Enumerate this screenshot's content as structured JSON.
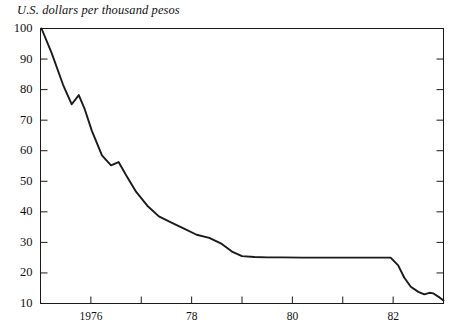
{
  "chart_data": {
    "type": "line",
    "title": "U.S. dollars per thousand pesos",
    "xlabel": "",
    "ylabel": "U.S. dollars per thousand pesos",
    "ylim": [
      10,
      100
    ],
    "xlim": [
      1975.5,
      1983.5
    ],
    "grid": false,
    "legend": null,
    "y_ticks": [
      100,
      90,
      80,
      70,
      60,
      50,
      40,
      30,
      20,
      10
    ],
    "y_tick_labels": [
      "100",
      "90",
      "80",
      "70",
      "60",
      "50",
      "40",
      "30",
      "20",
      "10"
    ],
    "x_ticks": [
      1975.5,
      1976.5,
      1977.5,
      1978.5,
      1979.5,
      1980.5,
      1981.5,
      1982.5,
      1983.5
    ],
    "x_tick_labels": [
      "",
      "1976",
      "",
      "78",
      "",
      "80",
      "",
      "82",
      ""
    ],
    "x_labeled_ticks": [
      {
        "value": 1976.5,
        "label": "1976"
      },
      {
        "value": 1978.5,
        "label": "78"
      },
      {
        "value": 1980.5,
        "label": "80"
      },
      {
        "value": 1982.5,
        "label": "82"
      }
    ],
    "series": [
      {
        "name": "U.S. dollars per thousand pesos",
        "color": "#1a1a1a",
        "x": [
          1975.52,
          1975.72,
          1975.95,
          1976.12,
          1976.26,
          1976.38,
          1976.52,
          1976.72,
          1976.9,
          1977.05,
          1977.2,
          1977.4,
          1977.62,
          1977.85,
          1978.1,
          1978.35,
          1978.6,
          1978.85,
          1979.1,
          1979.3,
          1979.5,
          1979.75,
          1980.0,
          1980.3,
          1980.7,
          1981.2,
          1981.7,
          1982.1,
          1982.45,
          1982.6,
          1982.72,
          1982.85,
          1983.0,
          1983.12,
          1983.22,
          1983.3,
          1983.42,
          1983.5
        ],
        "y": [
          100.0,
          92.0,
          81.5,
          75.2,
          78.2,
          73.5,
          66.5,
          58.5,
          55.2,
          56.3,
          52.0,
          46.5,
          42.0,
          38.5,
          36.5,
          34.5,
          32.5,
          31.5,
          29.5,
          27.0,
          25.5,
          25.2,
          25.1,
          25.1,
          25.0,
          25.0,
          25.0,
          25.0,
          25.0,
          22.5,
          18.5,
          15.5,
          13.8,
          13.0,
          13.5,
          13.3,
          12.0,
          11.0
        ]
      }
    ],
    "annotations": []
  },
  "axes": {
    "frame_color": "#1a1a1a",
    "tick_color": "#1a1a1a",
    "line_width": 1.0
  }
}
